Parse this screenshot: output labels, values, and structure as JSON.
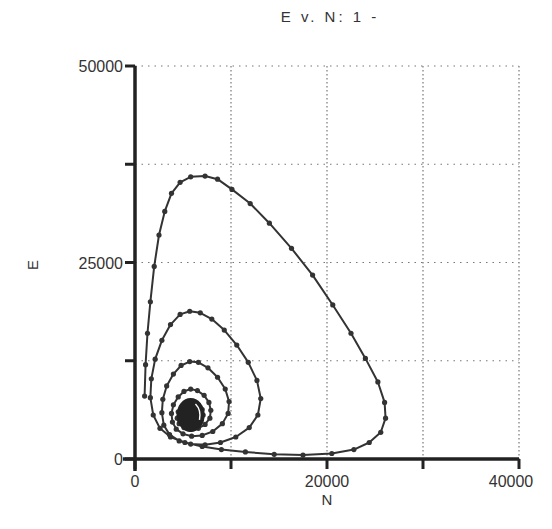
{
  "chart_data": {
    "type": "line",
    "title": "E v. N: 1 -",
    "xlabel": "N",
    "ylabel": "E",
    "xlim": [
      0,
      40000
    ],
    "ylim": [
      0,
      50000
    ],
    "x_ticks": [
      0,
      10000,
      20000,
      30000,
      40000
    ],
    "x_tick_labels": [
      "0",
      "",
      "20000",
      "",
      "40000"
    ],
    "y_ticks": [
      0,
      12500,
      25000,
      37500,
      50000
    ],
    "y_tick_labels": [
      "0",
      "",
      "25000",
      "",
      "50000"
    ],
    "grid": true,
    "grid_style": "dotted",
    "legend": null,
    "series": [
      {
        "name": "E v. N trajectory (damped spiral)",
        "marker": "dot",
        "color": "#333333",
        "points": [
          [
            1000,
            8000
          ],
          [
            1100,
            12000
          ],
          [
            1300,
            16000
          ],
          [
            1600,
            20000
          ],
          [
            2000,
            24500
          ],
          [
            2500,
            28500
          ],
          [
            3100,
            31500
          ],
          [
            3800,
            33800
          ],
          [
            4700,
            35200
          ],
          [
            5800,
            35900
          ],
          [
            7300,
            36000
          ],
          [
            8600,
            35600
          ],
          [
            10100,
            34300
          ],
          [
            12000,
            32500
          ],
          [
            14000,
            30000
          ],
          [
            16300,
            26800
          ],
          [
            18500,
            23400
          ],
          [
            20600,
            19600
          ],
          [
            22500,
            16000
          ],
          [
            24000,
            12800
          ],
          [
            25300,
            9800
          ],
          [
            26000,
            7200
          ],
          [
            26100,
            5200
          ],
          [
            25600,
            3400
          ],
          [
            24400,
            2100
          ],
          [
            22800,
            1200
          ],
          [
            20500,
            700
          ],
          [
            17500,
            500
          ],
          [
            14500,
            600
          ],
          [
            11500,
            900
          ],
          [
            9000,
            1200
          ],
          [
            7000,
            1600
          ],
          [
            5200,
            2100
          ],
          [
            3700,
            2800
          ],
          [
            2600,
            3900
          ],
          [
            1900,
            5600
          ],
          [
            1600,
            7800
          ],
          [
            1700,
            10200
          ],
          [
            2100,
            12700
          ],
          [
            2800,
            15100
          ],
          [
            3700,
            17100
          ],
          [
            4700,
            18400
          ],
          [
            5700,
            18800
          ],
          [
            6800,
            18600
          ],
          [
            8000,
            17800
          ],
          [
            9300,
            16400
          ],
          [
            10600,
            14500
          ],
          [
            11800,
            12300
          ],
          [
            12700,
            10000
          ],
          [
            13100,
            7700
          ],
          [
            12800,
            5600
          ],
          [
            11900,
            4000
          ],
          [
            10500,
            2800
          ],
          [
            8900,
            2100
          ],
          [
            7300,
            1800
          ],
          [
            5800,
            1900
          ],
          [
            4600,
            2300
          ],
          [
            3600,
            3100
          ],
          [
            3000,
            4300
          ],
          [
            2800,
            5900
          ],
          [
            2900,
            7600
          ],
          [
            3300,
            9300
          ],
          [
            4000,
            10800
          ],
          [
            4800,
            11900
          ],
          [
            5700,
            12400
          ],
          [
            6600,
            12300
          ],
          [
            7600,
            11600
          ],
          [
            8600,
            10400
          ],
          [
            9400,
            8900
          ],
          [
            9800,
            7300
          ],
          [
            9700,
            5800
          ],
          [
            9100,
            4500
          ],
          [
            8100,
            3500
          ],
          [
            7000,
            3000
          ],
          [
            5900,
            2900
          ],
          [
            5000,
            3200
          ],
          [
            4300,
            3800
          ],
          [
            3900,
            4700
          ],
          [
            3800,
            5800
          ],
          [
            4000,
            6900
          ],
          [
            4500,
            7900
          ],
          [
            5100,
            8600
          ],
          [
            5800,
            8900
          ],
          [
            6500,
            8700
          ],
          [
            7200,
            8100
          ],
          [
            7700,
            7200
          ],
          [
            7900,
            6200
          ],
          [
            7800,
            5200
          ],
          [
            7300,
            4400
          ],
          [
            6600,
            3900
          ],
          [
            5800,
            3800
          ],
          [
            5100,
            4000
          ],
          [
            4600,
            4500
          ],
          [
            4400,
            5200
          ],
          [
            4500,
            6000
          ],
          [
            4900,
            6700
          ],
          [
            5400,
            7100
          ],
          [
            6000,
            7200
          ],
          [
            6600,
            6900
          ],
          [
            7000,
            6300
          ],
          [
            7100,
            5600
          ],
          [
            6900,
            5000
          ],
          [
            6400,
            4600
          ],
          [
            5800,
            4500
          ],
          [
            5300,
            4700
          ],
          [
            5000,
            5200
          ],
          [
            5000,
            5800
          ],
          [
            5300,
            6300
          ],
          [
            5800,
            6500
          ],
          [
            6300,
            6300
          ],
          [
            6600,
            5900
          ],
          [
            6600,
            5400
          ],
          [
            6300,
            5000
          ],
          [
            5800,
            4900
          ],
          [
            5400,
            5100
          ],
          [
            5300,
            5500
          ],
          [
            5500,
            5900
          ],
          [
            5900,
            6000
          ],
          [
            6200,
            5800
          ],
          [
            6200,
            5400
          ],
          [
            5900,
            5200
          ],
          [
            5600,
            5300
          ],
          [
            5600,
            5600
          ],
          [
            5800,
            5700
          ]
        ]
      }
    ]
  }
}
